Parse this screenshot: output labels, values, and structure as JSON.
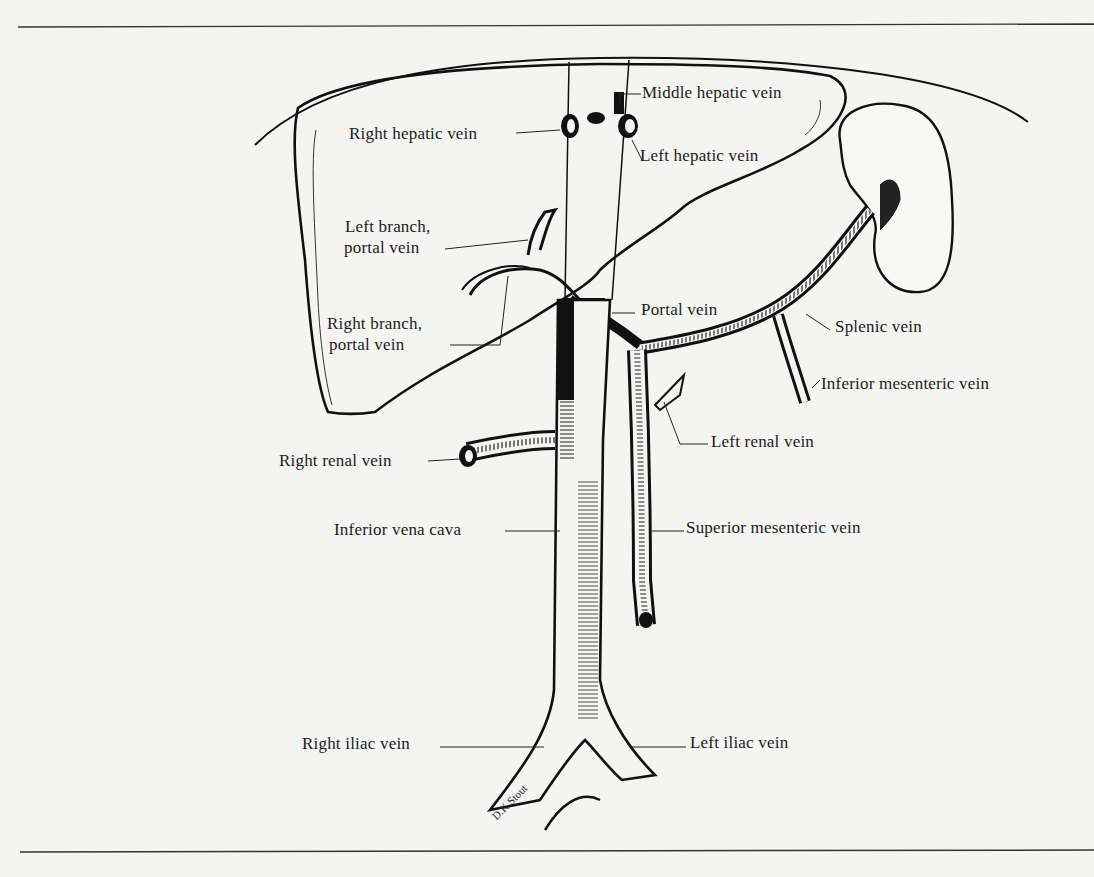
{
  "figure": {
    "signature": "D.K.Stout",
    "colors": {
      "ink": "#111111",
      "paper": "#f4f4f2",
      "rule": "#333333"
    }
  },
  "labels": {
    "middle_hepatic_vein": "Middle hepatic vein",
    "right_hepatic_vein": "Right hepatic vein",
    "left_hepatic_vein": "Left hepatic vein",
    "left_branch_portal_1": "Left branch,",
    "left_branch_portal_2": "portal vein",
    "right_branch_portal_1": "Right branch,",
    "right_branch_portal_2": "portal vein",
    "portal_vein": "Portal vein",
    "splenic_vein": "Splenic vein",
    "inferior_mesenteric_vein": "Inferior mesenteric vein",
    "left_renal_vein": "Left renal vein",
    "right_renal_vein": "Right renal vein",
    "inferior_vena_cava": "Inferior vena cava",
    "superior_mesenteric_vein": "Superior mesenteric vein",
    "right_iliac_vein": "Right iliac vein",
    "left_iliac_vein": "Left iliac vein"
  }
}
